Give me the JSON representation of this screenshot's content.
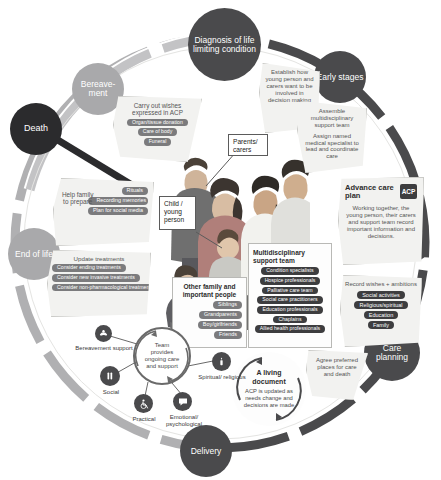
{
  "meta": {
    "colors": {
      "ring_dark": "#4a4a4c",
      "ring_mid": "#8d8d8f",
      "ring_light": "#b9b9bb",
      "node_dark": "#3d3d3f",
      "node_black": "#2b2b2d",
      "node_mid": "#6f6f71",
      "node_light": "#a9a9ab",
      "panel_fill": "#f2f2f0",
      "pill_fill": "#6f6f70",
      "accent_badge": "#3d3d3f"
    }
  },
  "nodes": [
    {
      "id": "diagnosis",
      "label": "Diagnosis of life limiting condition",
      "tone": "dark"
    },
    {
      "id": "early",
      "label": "Early stages",
      "tone": "dark"
    },
    {
      "id": "care",
      "label": "Care planning",
      "tone": "dark"
    },
    {
      "id": "delivery",
      "label": "Delivery",
      "tone": "dark"
    },
    {
      "id": "endoflife",
      "label": "End of life",
      "tone": "light"
    },
    {
      "id": "death",
      "label": "Death",
      "tone": "black"
    },
    {
      "id": "bereavement",
      "label": "Bereave- ment",
      "tone": "light"
    }
  ],
  "panels": {
    "establish": {
      "title": "Establish how young person and carers want to be involved in decision making",
      "pills": []
    },
    "assemble": {
      "title": "Assemble multidisciplinary support team",
      "subtitle": "Assign named medical specialist to lead and coordinate care",
      "pills": []
    },
    "advance_care_plan": {
      "title": "Advance care plan",
      "badge": "ACP",
      "body": "Working together, the young person, their carers and support team record important information and decisions."
    },
    "record_wishes": {
      "title": "Record wishes + ambitions",
      "pills": [
        "Social activities",
        "Religious/spiritual",
        "Education",
        "Family"
      ]
    },
    "agree_places": {
      "title": "Agree preferred places for care and death",
      "pills": []
    },
    "living_document": {
      "title": "A living document",
      "body": "ACP is updated as needs change and decisions are made"
    },
    "multidisciplinary": {
      "title": "Multidisciplinary support team",
      "pills": [
        "Condition specialists",
        "Hospice professionals",
        "Palliative care team",
        "Social care practitioners",
        "Education professionals",
        "Chaplains",
        "Allied health professionals"
      ]
    },
    "other_family": {
      "title": "Other family and important people",
      "pills": [
        "Siblings",
        "Grandparents",
        "Boy/girlfriends",
        "Friends"
      ]
    },
    "update_treatments": {
      "title": "Update treatments",
      "pills": [
        "Consider ending treatments",
        "Consider new invasive treatments",
        "Consider non-pharmacological treatments"
      ]
    },
    "help_family": {
      "title": "Help family to prepare",
      "pills": [
        "Rituals",
        "Recording memories",
        "Plan for social media"
      ]
    },
    "carry_out_wishes": {
      "title": "Carry out wishes expressed in ACP",
      "pills": [
        "Organ/tissue donation",
        "Care of body",
        "Funeral"
      ]
    }
  },
  "callouts": {
    "parents": "Parents/ carers",
    "child": "Child / young person"
  },
  "hub": {
    "label": "Team provides ongoing care and support",
    "spokes": [
      {
        "id": "bereavement-support",
        "label": "Bereavement support",
        "icon": "hands-holding-icon"
      },
      {
        "id": "social",
        "label": "Social",
        "icon": "people-icon"
      },
      {
        "id": "practical",
        "label": "Practical",
        "icon": "wheelchair-icon"
      },
      {
        "id": "emotional",
        "label": "Emotional/ psychological",
        "icon": "speech-bubble-icon"
      },
      {
        "id": "spiritual",
        "label": "Spiritual/ religious",
        "icon": "candle-icon"
      }
    ]
  }
}
